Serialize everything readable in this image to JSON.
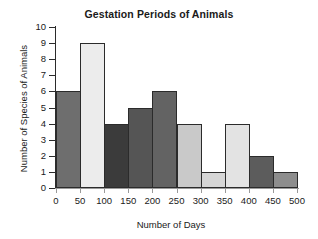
{
  "chart_data": {
    "type": "bar",
    "title": "Gestation Periods of Animals",
    "xlabel": "Number of Days",
    "ylabel": "Number of Species of Animals",
    "categories": [
      "0-50",
      "50-100",
      "100-150",
      "150-200",
      "200-250",
      "250-300",
      "300-350",
      "350-400",
      "400-450",
      "450-500"
    ],
    "bin_edges": [
      0,
      50,
      100,
      150,
      200,
      250,
      300,
      350,
      400,
      450,
      500
    ],
    "values": [
      6,
      9,
      4,
      5,
      6,
      4,
      1,
      4,
      2,
      1
    ],
    "bar_colors": [
      "#6e6e6e",
      "#ececec",
      "#3b3b3b",
      "#555555",
      "#636363",
      "#c9c9c9",
      "#d6d6d6",
      "#e3e3e3",
      "#5c5c5c",
      "#8d8d8d"
    ],
    "xlim": [
      0,
      500
    ],
    "ylim": [
      0,
      10
    ],
    "x_ticks": [
      "0",
      "50",
      "100",
      "150",
      "200",
      "250",
      "300",
      "350",
      "400",
      "450",
      "500"
    ],
    "y_ticks": [
      "0",
      "1",
      "2",
      "3",
      "4",
      "5",
      "6",
      "7",
      "8",
      "9",
      "10"
    ],
    "grid": false,
    "legend": "none",
    "axis_color": "#2b2b2b",
    "bar_edge_color": "#2b2b2b",
    "background": "#ffffff"
  }
}
